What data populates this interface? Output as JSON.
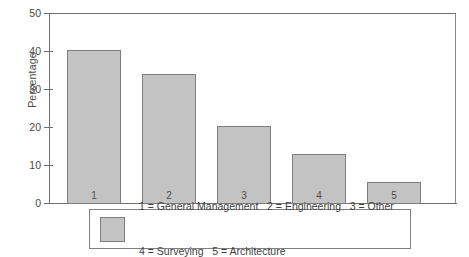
{
  "chart_data": {
    "type": "bar",
    "title": "",
    "subtitle": "",
    "xlabel": "",
    "ylabel": "Percentage",
    "categories": [
      "1",
      "2",
      "3",
      "4",
      "5"
    ],
    "values": [
      40.2,
      34.0,
      20.4,
      13.2,
      5.8
    ],
    "ylim": [
      0,
      50
    ],
    "yticks": [
      "0",
      "10",
      "20",
      "30",
      "40",
      "50"
    ],
    "grid": false,
    "legend_position": "below-plot",
    "legend_entries": [
      "1 = General Management",
      "2 = Engineering",
      "3 = Other",
      "4 = Surveying",
      "5 = Architecture"
    ],
    "legend_lines": [
      "1 = General Management   2 = Engineering   3 = Other",
      "4 = Surveying   5 = Architecture"
    ],
    "bar_color": "#c3c3c3",
    "bar_edge_color": "#7d7d7d",
    "axis_color": "#6f6f6f"
  },
  "axis": {
    "y_title": "Percentage",
    "ticks": [
      {
        "label": "50",
        "value": 50
      },
      {
        "label": "40",
        "value": 40
      },
      {
        "label": "30",
        "value": 30
      },
      {
        "label": "20",
        "value": 20
      },
      {
        "label": "10",
        "value": 10
      },
      {
        "label": "0",
        "value": 0
      }
    ]
  },
  "bars": [
    {
      "label": "1",
      "value": 40.2
    },
    {
      "label": "2",
      "value": 34.0
    },
    {
      "label": "3",
      "value": 20.4
    },
    {
      "label": "4",
      "value": 13.2
    },
    {
      "label": "5",
      "value": 5.8
    }
  ],
  "legend": {
    "line1": "1 = General Management   2 = Engineering   3 = Other",
    "line2": "4 = Surveying   5 = Architecture"
  }
}
